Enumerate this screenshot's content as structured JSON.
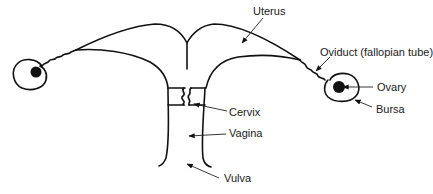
{
  "diagram": {
    "labels": [
      {
        "id": "uterus",
        "text": "Uterus",
        "x": 253,
        "y": 5
      },
      {
        "id": "oviduct",
        "text": "Oviduct (fallopian tube)",
        "x": 320,
        "y": 46
      },
      {
        "id": "ovary",
        "text": "Ovary",
        "x": 377,
        "y": 81
      },
      {
        "id": "bursa",
        "text": "Bursa",
        "x": 376,
        "y": 103
      },
      {
        "id": "cervix",
        "text": "Cervix",
        "x": 229,
        "y": 106
      },
      {
        "id": "vagina",
        "text": "Vagina",
        "x": 229,
        "y": 127
      },
      {
        "id": "vulva",
        "text": "Vulva",
        "x": 224,
        "y": 172
      }
    ]
  }
}
